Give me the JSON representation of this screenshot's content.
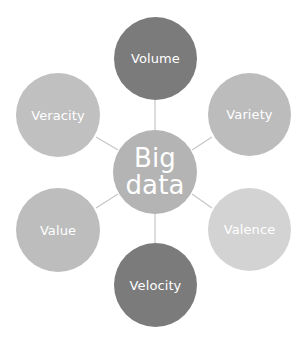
{
  "diagram": {
    "center": {
      "label": "Big\ndata",
      "color": "#b4b4b4"
    },
    "nodes": [
      {
        "label": "Volume",
        "color": "#7b7b7b"
      },
      {
        "label": "Variety",
        "color": "#bcbcbc"
      },
      {
        "label": "Valence",
        "color": "#d3d3d3"
      },
      {
        "label": "Velocity",
        "color": "#7b7b7b"
      },
      {
        "label": "Value",
        "color": "#bdbdbd"
      },
      {
        "label": "Veracity",
        "color": "#c0c0c0"
      }
    ],
    "connector_color": "#c6c6c6"
  }
}
